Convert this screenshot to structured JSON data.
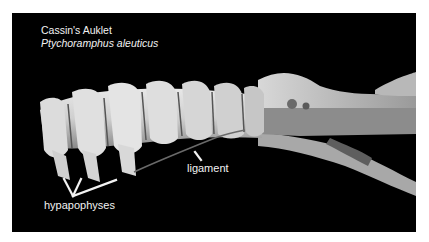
{
  "figure": {
    "common_name": "Cassin's Auklet",
    "scientific_name": "Ptychoramphus aleuticus",
    "background_color": "#000000",
    "page_color": "#ffffff",
    "text_color": "#f2f2f2"
  },
  "annotations": {
    "ligament": "ligament",
    "hypapophyses": "hypapophyses"
  }
}
